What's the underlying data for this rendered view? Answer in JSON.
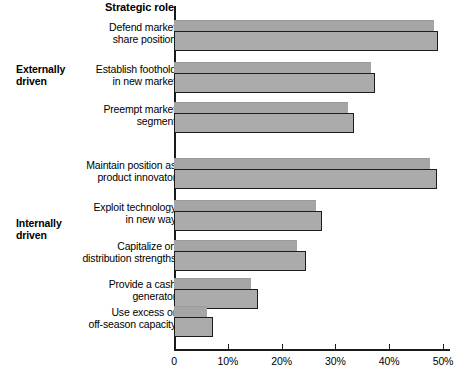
{
  "chart_data": {
    "type": "bar",
    "orientation": "horizontal",
    "title": "Strategic role",
    "xlabel": "",
    "ylabel": "",
    "xlim": [
      0,
      51.5
    ],
    "grid": false,
    "legend": false,
    "tick_labels": [
      "0",
      "10%",
      "20%",
      "30%",
      "40%",
      "50%"
    ],
    "tick_values": [
      0,
      10,
      20,
      30,
      40,
      50
    ],
    "sections": [
      {
        "label": "Externally\ndriven",
        "categories": [
          0,
          1,
          2
        ]
      },
      {
        "label": "Internally\ndriven",
        "categories": [
          3,
          4,
          5,
          6,
          7
        ]
      }
    ],
    "categories": [
      "Defend market\nshare position",
      "Establish foothold\nin new market",
      "Preempt market\nsegment",
      "Maintain position as\nproduct innovator",
      "Exploit technology\nin new way",
      "Capitalize on\ndistribution strengths",
      "Provide a cash\ngenerator",
      "Use excess or\noff-season capacity"
    ],
    "series": [
      {
        "name": "back",
        "values": [
          48.3,
          36.6,
          32.3,
          47.6,
          26.4,
          22.9,
          14.3,
          6.1
        ]
      },
      {
        "name": "front",
        "values": [
          49.0,
          37.4,
          33.4,
          48.9,
          27.5,
          24.5,
          15.6,
          7.3
        ]
      }
    ],
    "colors": {
      "bar_fill": "#a9a9a9",
      "bar_outline": "#1c1c1c",
      "axis": "#1a1a1a"
    }
  },
  "layout": {
    "group_tops": [
      14,
      56,
      96,
      152,
      194,
      234,
      272,
      300
    ],
    "back_height": 13,
    "front_height": 20,
    "front_offset": 11
  }
}
